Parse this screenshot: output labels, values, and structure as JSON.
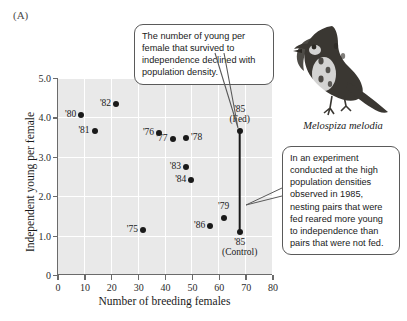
{
  "panel": {
    "label": "(A)"
  },
  "callouts": {
    "top": "The number of young per female that survived to independence declined with population density.",
    "right": "In an experiment conducted at the high population densities observed in 1985, nesting pairs that were fed reared more young to independence than pairs that were not fed."
  },
  "species": {
    "caption": "Melospiza melodia",
    "illustration": "song-sparrow"
  },
  "chart_data": {
    "type": "scatter",
    "title": "",
    "xlabel": "Number of breeding females",
    "ylabel": "Independent young per female",
    "xlim": [
      0,
      80
    ],
    "ylim": [
      0,
      5.0
    ],
    "xticks": [
      "0",
      "10",
      "20",
      "30",
      "40",
      "50",
      "60",
      "70",
      "80"
    ],
    "yticks": [
      "0",
      "1.0",
      "2.0",
      "3.0",
      "4.0",
      "5.0"
    ],
    "grid": true,
    "grid_color": "#ffffff",
    "plot_background": "#e9e9e9",
    "point_color": "#1a1a1a",
    "legend": "none",
    "points": [
      {
        "label": "'80",
        "x": 9,
        "y": 4.05,
        "label_pos": "left"
      },
      {
        "label": "'82",
        "x": 22,
        "y": 4.35,
        "label_pos": "left"
      },
      {
        "label": "'81",
        "x": 14,
        "y": 3.65,
        "label_pos": "left"
      },
      {
        "label": "'76",
        "x": 38,
        "y": 3.6,
        "label_pos": "left"
      },
      {
        "label": "'77",
        "x": 43,
        "y": 3.45,
        "label_pos": "left"
      },
      {
        "label": "'78",
        "x": 48,
        "y": 3.48,
        "label_pos": "right"
      },
      {
        "label": "'83",
        "x": 48,
        "y": 2.75,
        "label_pos": "left"
      },
      {
        "label": "'84",
        "x": 50,
        "y": 2.4,
        "label_pos": "left"
      },
      {
        "label": "'75",
        "x": 32,
        "y": 1.15,
        "label_pos": "left"
      },
      {
        "label": "'86",
        "x": 57,
        "y": 1.25,
        "label_pos": "left"
      },
      {
        "label": "'79",
        "x": 62,
        "y": 1.45,
        "label_pos": "above"
      },
      {
        "label": "'85\n(Fed)",
        "x": 68,
        "y": 3.65,
        "label_pos": "above"
      },
      {
        "label": "'85\n(Control)",
        "x": 68,
        "y": 1.1,
        "label_pos": "below"
      }
    ],
    "connector": {
      "description": "vertical line joining '85 (Fed) and '85 (Control)",
      "x": 68,
      "y_from": 3.65,
      "y_to": 1.1
    }
  }
}
